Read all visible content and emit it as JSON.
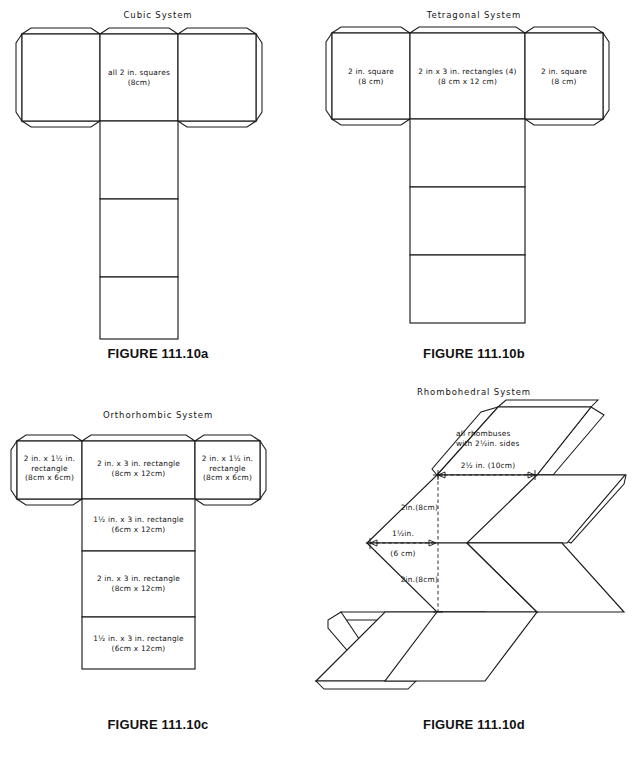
{
  "document": {
    "kind": "technical-illustration",
    "subject": "Crystal system box nets (fold-up patterns)",
    "ink_color": "#1a1a1a",
    "paper_color": "#ffffff"
  },
  "panels": [
    {
      "id": "cubic",
      "title": "Cubic System",
      "caption": "FIGURE 111.10a",
      "labels": [
        {
          "id": "cubic-main",
          "lines": "all 2 in. squares\n(8cm)"
        }
      ]
    },
    {
      "id": "tetragonal",
      "title": "Tetragonal System",
      "caption": "FIGURE 111.10b",
      "labels": [
        {
          "id": "tetra-left",
          "lines": "2 in. square\n(8 cm)"
        },
        {
          "id": "tetra-center",
          "lines": "2 in x 3 in. rectangles (4)\n(8 cm x 12 cm)"
        },
        {
          "id": "tetra-right",
          "lines": "2 in. square\n(8 cm)"
        }
      ]
    },
    {
      "id": "orthorhombic",
      "title": "Orthorhombic System",
      "caption": "FIGURE 111.10c",
      "labels": [
        {
          "id": "ortho-left",
          "lines": "2 in. x 1½ in.\nrectangle\n(8cm x 6cm)"
        },
        {
          "id": "ortho-top",
          "lines": "2 in. x 3 in. rectangle\n(8cm x 12cm)"
        },
        {
          "id": "ortho-right",
          "lines": "2 in. x 1½ in.\nrectangle\n(8cm x 6cm)"
        },
        {
          "id": "ortho-row2",
          "lines": "1½ in. x 3 in. rectangle\n(6cm x 12cm)"
        },
        {
          "id": "ortho-row3",
          "lines": "2 in. x 3 in. rectangle\n(8cm x 12cm)"
        },
        {
          "id": "ortho-row4",
          "lines": "1½ in. x 3 in. rectangle\n(6cm x 12cm)"
        }
      ]
    },
    {
      "id": "rhombohedral",
      "title": "Rhombohedral System",
      "caption": "FIGURE 111.10d",
      "labels": [
        {
          "id": "rhomb-note",
          "lines": "all rhombuses\nwith 2½in. sides"
        }
      ],
      "dimensions": [
        {
          "id": "rhomb-dim-top",
          "text": "2½ in. (10cm)"
        },
        {
          "id": "rhomb-dim-upper",
          "text": "2in.(8cm)"
        },
        {
          "id": "rhomb-dim-left",
          "text": "1½in."
        },
        {
          "id": "rhomb-dim-left2",
          "text": "(6 cm)"
        },
        {
          "id": "rhomb-dim-lower",
          "text": "2in.(8cm)"
        }
      ]
    }
  ]
}
